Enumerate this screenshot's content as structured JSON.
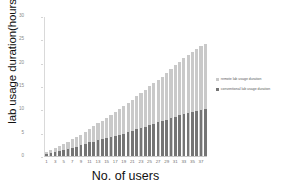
{
  "chart_data": {
    "type": "bar",
    "title": "",
    "xlabel": "No. of users",
    "ylabel": "lab usage duration(hours )",
    "ylim": [
      0,
      30
    ],
    "yticks": [
      0,
      5,
      10,
      15,
      20,
      25,
      30
    ],
    "xticks": [
      1,
      3,
      5,
      7,
      9,
      11,
      13,
      15,
      17,
      19,
      21,
      23,
      25,
      27,
      29,
      31,
      33,
      35,
      37
    ],
    "categories": [
      1,
      2,
      3,
      4,
      5,
      6,
      7,
      8,
      9,
      10,
      11,
      12,
      13,
      14,
      15,
      16,
      17,
      18,
      19,
      20,
      21,
      22,
      23,
      24,
      25,
      26,
      27,
      28,
      29,
      30,
      31,
      32,
      33,
      34,
      35,
      36,
      37,
      38
    ],
    "grid": false,
    "legend_position": "right",
    "bar_style": "overlapping",
    "series": [
      {
        "name": "remote lab usage duration",
        "color": "#c9c9c9",
        "values": [
          0.9,
          1.3,
          1.7,
          2.2,
          2.6,
          3.1,
          3.6,
          4.1,
          4.6,
          5.2,
          5.8,
          6.4,
          7.0,
          7.6,
          8.2,
          8.8,
          9.4,
          10.0,
          10.7,
          11.4,
          12.1,
          12.8,
          13.5,
          14.2,
          14.9,
          15.6,
          16.3,
          17.0,
          17.8,
          18.6,
          19.4,
          20.2,
          20.9,
          21.6,
          22.3,
          22.9,
          23.5,
          24.1
        ]
      },
      {
        "name": "conventional lab usage duration",
        "color": "#757575",
        "values": [
          0.5,
          0.7,
          0.9,
          1.1,
          1.3,
          1.5,
          1.8,
          2.0,
          2.3,
          2.6,
          2.9,
          3.1,
          3.4,
          3.6,
          3.9,
          4.1,
          4.3,
          4.5,
          4.8,
          5.1,
          5.4,
          5.7,
          6.0,
          6.3,
          6.6,
          6.9,
          7.2,
          7.5,
          7.8,
          8.1,
          8.4,
          8.7,
          8.9,
          9.2,
          9.5,
          9.7,
          9.9,
          10.1
        ]
      }
    ]
  },
  "legend": {
    "items": [
      {
        "label": "remote lab usage duration",
        "color": "#c9c9c9"
      },
      {
        "label": "conventional lab usage duration",
        "color": "#757575"
      }
    ]
  }
}
